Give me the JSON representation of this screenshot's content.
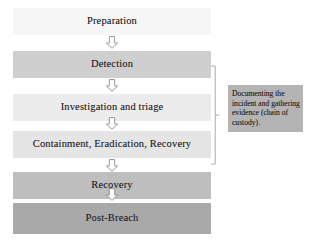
{
  "diagram": {
    "stages": [
      {
        "label": "Preparation",
        "fill": "#f6f6f6"
      },
      {
        "label": "Detection",
        "fill": "#cfcfcf"
      },
      {
        "label": "Investigation and triage",
        "fill": "#ececec"
      },
      {
        "label": "Containment, Eradication, Recovery",
        "fill": "#e5e5e5"
      },
      {
        "label": "Recovery",
        "fill": "#bebebe"
      },
      {
        "label": "Post-Breach",
        "fill": "#a9a9a9"
      }
    ],
    "connectors": [
      {
        "icon": "down-arrow-icon"
      },
      {
        "icon": "down-arrow-icon"
      },
      {
        "icon": "down-arrow-icon"
      },
      {
        "icon": "down-arrow-icon"
      },
      {
        "icon": "down-arrow-icon"
      }
    ],
    "bracket": {
      "icon": "bracket-icon",
      "spans_stages": [
        "Detection",
        "Investigation and triage",
        "Containment, Eradication, Recovery"
      ]
    },
    "annotation": {
      "text": "Documenting the incident and gathering evidence (chain of custody).",
      "fill": "#b4b4b4"
    }
  }
}
